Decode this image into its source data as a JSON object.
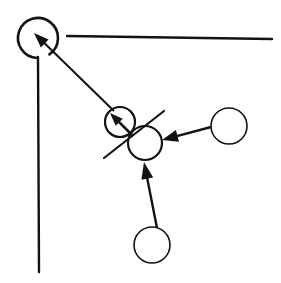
{
  "figure": {
    "background_color": "#ffffff",
    "ink_color": "#131313",
    "width": 281,
    "height": 283
  },
  "nodes": [
    {
      "id": "corner-circle",
      "label": "open circle at corner junction",
      "cx": 38,
      "cy": 38,
      "r": 20,
      "stroke_width": 2.6,
      "open": true,
      "gap_start_deg": 55,
      "gap_end_deg": 92
    },
    {
      "id": "upper-middle-circle",
      "label": "upper middle circle",
      "cx": 120,
      "cy": 122,
      "r": 15,
      "stroke_width": 2.2,
      "open": false
    },
    {
      "id": "lower-middle-circle",
      "label": "lower middle circle",
      "cx": 145,
      "cy": 143,
      "r": 17,
      "stroke_width": 2.2,
      "open": false
    },
    {
      "id": "right-circle",
      "label": "right circle",
      "cx": 229,
      "cy": 126,
      "r": 18,
      "stroke_width": 1.6,
      "open": false
    },
    {
      "id": "bottom-circle",
      "label": "bottom circle",
      "cx": 152,
      "cy": 245,
      "r": 18,
      "stroke_width": 1.6,
      "open": false
    }
  ],
  "edges": [
    {
      "id": "corner-horizontal-line",
      "label": "horizontal boundary line to right edge",
      "x1": 67,
      "y1": 36,
      "x2": 272,
      "y2": 39,
      "stroke_width": 2.4
    },
    {
      "id": "corner-vertical-line",
      "label": "vertical boundary line to bottom",
      "x1": 38,
      "y1": 57,
      "x2": 39,
      "y2": 272,
      "stroke_width": 2.4
    },
    {
      "id": "slash-line",
      "label": "diagonal slash across middle circles",
      "x1": 164,
      "y1": 111,
      "x2": 104,
      "y2": 158,
      "stroke_width": 2.2
    }
  ],
  "arrows": [
    {
      "id": "arrow-long-to-corner",
      "label": "long arrow from middle circle to corner circle",
      "from_x": 114,
      "from_y": 111,
      "to_x": 34,
      "to_y": 33,
      "stroke_width": 2.0,
      "head_length": 15,
      "head_width": 11
    },
    {
      "id": "arrow-inside-upper-circle",
      "label": "short arrow inside upper middle circle",
      "from_x": 133,
      "from_y": 136,
      "to_x": 110,
      "to_y": 113,
      "stroke_width": 2.6,
      "head_length": 13,
      "head_width": 10
    },
    {
      "id": "arrow-right-to-middle",
      "label": "arrow from right circle to lower middle circle",
      "from_x": 211,
      "from_y": 127,
      "to_x": 162,
      "to_y": 140,
      "stroke_width": 2.4,
      "head_length": 16,
      "head_width": 12
    },
    {
      "id": "arrow-bottom-to-middle",
      "label": "arrow from bottom circle to lower middle circle",
      "from_x": 157,
      "from_y": 228,
      "to_x": 144,
      "to_y": 162,
      "stroke_width": 2.4,
      "head_length": 17,
      "head_width": 12
    }
  ]
}
